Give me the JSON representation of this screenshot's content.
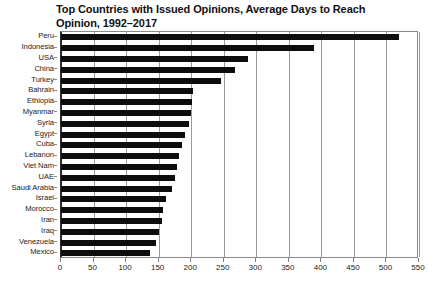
{
  "chart_data": {
    "type": "bar",
    "orientation": "horizontal",
    "title": "Top Countries with Issued Opinions, Average Days to Reach Opinion, 1992–2017",
    "xlabel": "",
    "ylabel": "",
    "xlim": [
      0,
      550
    ],
    "xticks": [
      0,
      50,
      100,
      150,
      200,
      250,
      300,
      350,
      400,
      450,
      500,
      550
    ],
    "xtick_labels": [
      "0",
      "50",
      "100",
      "150",
      "200",
      "250",
      "300",
      "350",
      "400",
      "450",
      "500",
      "550"
    ],
    "grid": "vertical",
    "legend": "none",
    "bar_color": "#0d0d0d",
    "categories": [
      "Peru",
      "Indonesia",
      "USA",
      "China",
      "Turkey",
      "Bahrain",
      "Ethiopia",
      "Myanmar",
      "Syria",
      "Egypt",
      "Cuba",
      "Lebanon",
      "Viet Nam",
      "UAE",
      "Saudi Arabia",
      "Israel",
      "Morocco",
      "Iran",
      "Iraq",
      "Venezuela",
      "Mexico"
    ],
    "values": [
      520,
      388,
      288,
      268,
      246,
      203,
      202,
      200,
      197,
      191,
      186,
      182,
      178,
      175,
      171,
      162,
      157,
      155,
      151,
      146,
      137
    ]
  }
}
